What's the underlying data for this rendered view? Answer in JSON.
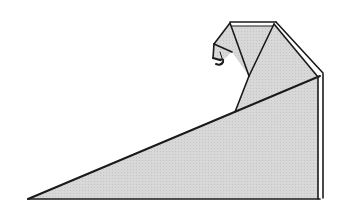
{
  "diagram": {
    "colors": {
      "background": "#ffffff",
      "paper": "#d6d6d6",
      "paper_light": "#e4e4e4",
      "edge": "#1a1a1a",
      "highlight": "#ffffff"
    },
    "shapes": {
      "body_triangle": "28,199 318,199 318,78 235,112",
      "neck_panel": "235,112 318,78 274,23 249,76",
      "head_front": "230,23 274,23 249,76",
      "head_side": "230,23 214,44 232,52 249,76",
      "beak_flap": "214,44 213,58 221,62 232,52",
      "top_strip": "230,23 274,23 276,25 232,25",
      "right_strip": "274,23 323,74 323,199 318,199 318,78"
    },
    "lines": [
      {
        "id": "hypotenuse",
        "x1": 28,
        "y1": 199,
        "x2": 320,
        "y2": 76
      },
      {
        "id": "base",
        "x1": 28,
        "y1": 199,
        "x2": 320,
        "y2": 199
      },
      {
        "id": "right-edge-inner",
        "x1": 318,
        "y1": 78,
        "x2": 318,
        "y2": 199
      },
      {
        "id": "right-edge-outer",
        "x1": 323,
        "y1": 74,
        "x2": 323,
        "y2": 198
      },
      {
        "id": "back-ridge-inner",
        "x1": 274,
        "y1": 23,
        "x2": 318,
        "y2": 76
      },
      {
        "id": "back-ridge-outer",
        "x1": 276,
        "y1": 22,
        "x2": 323,
        "y2": 73
      },
      {
        "id": "top-edge",
        "x1": 230,
        "y1": 23,
        "x2": 275,
        "y2": 23
      },
      {
        "id": "top-edge-under",
        "x1": 232,
        "y1": 26,
        "x2": 273,
        "y2": 26
      },
      {
        "id": "neck-fold",
        "x1": 235,
        "y1": 112,
        "x2": 249,
        "y2": 76
      },
      {
        "id": "head-left-fold",
        "x1": 230,
        "y1": 23,
        "x2": 249,
        "y2": 76
      },
      {
        "id": "head-right-fold",
        "x1": 274,
        "y1": 23,
        "x2": 249,
        "y2": 76
      },
      {
        "id": "crown-back",
        "x1": 230,
        "y1": 23,
        "x2": 214,
        "y2": 44
      },
      {
        "id": "beak-fold",
        "x1": 214,
        "y1": 44,
        "x2": 232,
        "y2": 52
      },
      {
        "id": "beak-front",
        "x1": 214,
        "y1": 44,
        "x2": 213,
        "y2": 58
      }
    ]
  }
}
